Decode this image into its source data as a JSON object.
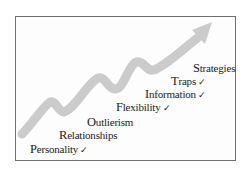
{
  "diagram": {
    "type": "staircase-with-rising-arrow",
    "arrow_color": "#c9c9c9",
    "frame_color": "#6f6f6f",
    "check_glyph": "✓",
    "steps": [
      {
        "cap": "P",
        "rest": "ersonality",
        "checked": "✓"
      },
      {
        "cap": "R",
        "rest": "elationships",
        "checked": ""
      },
      {
        "cap": "O",
        "rest": "utlierism",
        "checked": ""
      },
      {
        "cap": "F",
        "rest": "lexibility",
        "checked": "✓"
      },
      {
        "cap": "I",
        "rest": "nformation",
        "checked": "✓"
      },
      {
        "cap": "T",
        "rest": "raps",
        "checked": "✓"
      },
      {
        "cap": "S",
        "rest": "trategies",
        "checked": ""
      }
    ]
  }
}
